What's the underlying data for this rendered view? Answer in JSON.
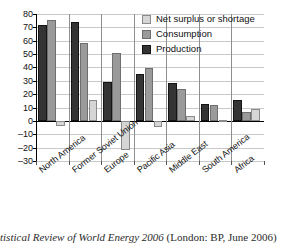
{
  "chart_data": {
    "type": "bar",
    "title": "",
    "xlabel": "",
    "ylabel": "",
    "ylim": [
      -30,
      80
    ],
    "ytick_step": 10,
    "yticks": [
      80,
      70,
      60,
      50,
      40,
      30,
      20,
      10,
      0,
      -10,
      -20,
      -30
    ],
    "ytick_labels": [
      "80",
      "70",
      "60",
      "50",
      "40",
      "30",
      "20",
      "10",
      "0",
      "–10",
      "–20",
      "–30"
    ],
    "grid": true,
    "legend_position": "top-right",
    "categories": [
      "North America",
      "Former Soviet Union",
      "Europe",
      "Pacific Asia",
      "Middle East",
      "South America",
      "Africa"
    ],
    "series": [
      {
        "name": "Production",
        "color": "#343434",
        "values": [
          72,
          74,
          29,
          35,
          28.5,
          13,
          16
        ]
      },
      {
        "name": "Consumption",
        "color": "#9a9a9a",
        "values": [
          75.5,
          58,
          51,
          39.5,
          24,
          12,
          7
        ]
      },
      {
        "name": "Net surplus or shortage",
        "color": "#d6d6d6",
        "values": [
          -3.5,
          16,
          -21.5,
          -4.5,
          4,
          1,
          9
        ]
      }
    ],
    "legend_order": [
      "Net surplus or shortage",
      "Consumption",
      "Production"
    ]
  },
  "legend": {
    "items": [
      {
        "label": "Net surplus or shortage",
        "swatch": "net"
      },
      {
        "label": "Consumption",
        "swatch": "cons"
      },
      {
        "label": "Production",
        "swatch": "prod"
      }
    ]
  },
  "caption": {
    "italic_part": "tistical Review of World Energy 2006",
    "roman_part": " (London: BP, June 2006)"
  },
  "colors": {
    "production": "#343434",
    "consumption": "#9a9a9a",
    "net": "#d6d6d6",
    "gridline": "#c9c9c9",
    "axis": "#000000",
    "separator": "#8f8f8f"
  }
}
